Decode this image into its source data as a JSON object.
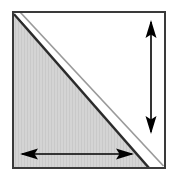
{
  "figure": {
    "canvas": {
      "width": 175,
      "height": 184,
      "background": "#ffffff"
    },
    "colors": {
      "outline": "#3a3a3a",
      "shaded_fill": "#d2d2d2",
      "shaded_fill_texture": "#c7c7c7",
      "unshaded_fill": "#ffffff",
      "diagonal_dark_edge": "#2b2b2b",
      "diagonal_light_edge": "#9a9a9a",
      "gap": "#ffffff",
      "arrow": "#000000"
    },
    "shapes": {
      "square": {
        "name": "square-outline",
        "x": 12,
        "y": 11,
        "width": 153,
        "height": 158,
        "stroke_width": 2
      },
      "shaded_triangle": {
        "name": "lower-left-shaded-triangle",
        "fill": "#d2d2d2",
        "points": "14,15 14,167 147,167"
      },
      "unshaded_triangle": {
        "name": "upper-right-unshaded-triangle",
        "fill": "#ffffff",
        "points": "20,13 163,13 163,166"
      },
      "diagonal_gap": {
        "name": "diagonal-white-gap",
        "from": [
          17,
          12
        ],
        "to": [
          164,
          168
        ],
        "width": 5
      }
    },
    "arrows": {
      "vertical": {
        "name": "vertical-dimension-arrow",
        "x": 151,
        "y_top": 21,
        "y_bottom": 133,
        "shaft_width": 1.6,
        "head_width": 11,
        "head_length": 17,
        "double_headed": true,
        "label": ""
      },
      "horizontal": {
        "name": "horizontal-dimension-arrow",
        "y": 154,
        "x_left": 21,
        "x_right": 133,
        "shaft_width": 1.6,
        "head_width": 11,
        "head_length": 17,
        "double_headed": true,
        "label": ""
      }
    }
  }
}
